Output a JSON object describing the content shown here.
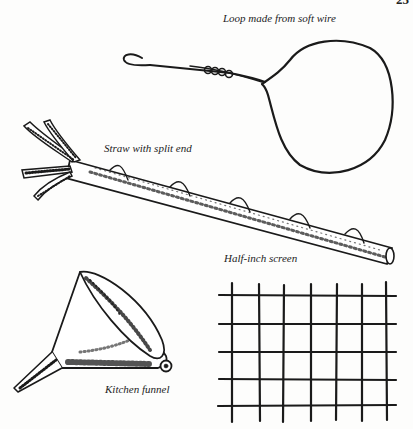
{
  "page": {
    "number": "25"
  },
  "captions": {
    "loop": "Loop made from soft wire",
    "straw": "Straw with split end",
    "screen": "Half-inch screen",
    "funnel": "Kitchen funnel"
  },
  "illustrations": [
    {
      "name": "wire-loop",
      "caption_key": "loop"
    },
    {
      "name": "split-straw",
      "caption_key": "straw"
    },
    {
      "name": "half-inch-screen",
      "caption_key": "screen"
    },
    {
      "name": "kitchen-funnel",
      "caption_key": "funnel"
    }
  ],
  "colors": {
    "ink": "#1a1a1a",
    "paper": "#fdfdfc"
  }
}
